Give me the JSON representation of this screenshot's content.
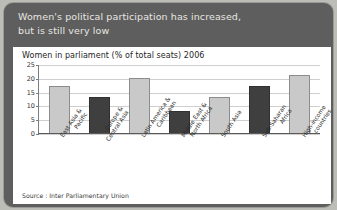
{
  "panel": {
    "headline_line1": "Women's political participation has increased,",
    "headline_line2": "but is still very low"
  },
  "source": "Source : Inter Parliamentary Union",
  "colors": {
    "panel_background": "#5e5e5e",
    "page_background": "#bdbdb8",
    "card_background": "#ffffff",
    "bar_light": "#c9c9c9",
    "bar_dark": "#3f3f3f",
    "gridline": "#cfcfcf",
    "headline_text": "#e8e6e2"
  },
  "chart_data": {
    "type": "bar",
    "title": "Women in parliament (% of total seats) 2006",
    "xlabel": "",
    "ylabel": "",
    "ylim": [
      0,
      25
    ],
    "yticks": [
      0,
      5,
      10,
      15,
      20,
      25
    ],
    "grid": true,
    "legend": "none",
    "categories": [
      "East Asia & Pacific",
      "Europe & Central Asia",
      "Latin America & Caribbean",
      "Middle East & North Africa",
      "South Asia",
      "Sub-Saharan Africa",
      "High-income countries"
    ],
    "category_lines": [
      [
        "East Asia &",
        "Pacific"
      ],
      [
        "Europe &",
        "Central Asia"
      ],
      [
        "Latin America &",
        "Caribbean"
      ],
      [
        "Middle East &",
        "North Africa"
      ],
      [
        "South Asia"
      ],
      [
        "Sub-Saharan",
        "Africa"
      ],
      [
        "High-income",
        "countries"
      ]
    ],
    "values": [
      17,
      13,
      20,
      8,
      13,
      17,
      21
    ],
    "bar_shades": [
      "light",
      "dark",
      "light",
      "dark",
      "light",
      "dark",
      "light"
    ]
  }
}
